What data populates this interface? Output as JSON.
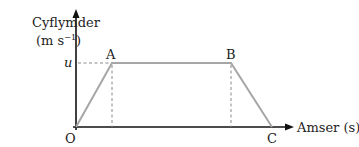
{
  "diagram": {
    "type": "velocity-time graph",
    "y_axis": {
      "label_line1": "Cyflymder",
      "label_line2": "(m s",
      "unit_exp": "−1",
      "label_close": ")"
    },
    "x_axis": {
      "label": "Amser (s)"
    },
    "origin_label": "O",
    "points": {
      "A": {
        "label": "A"
      },
      "B": {
        "label": "B"
      },
      "C": {
        "label": "C"
      }
    },
    "u_label": "u",
    "colors": {
      "axis": "#111111",
      "graph_line": "#a6a6a6",
      "dashed": "#888888"
    }
  }
}
